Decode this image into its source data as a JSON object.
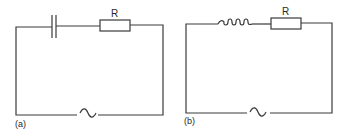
{
  "figure": {
    "circuits": [
      {
        "id": "a",
        "caption": "(a)",
        "components": [
          "capacitor",
          "resistor",
          "ac-source"
        ],
        "resistor_label": "R",
        "source_symbol": "~"
      },
      {
        "id": "b",
        "caption": "(b)",
        "components": [
          "inductor",
          "resistor",
          "ac-source"
        ],
        "resistor_label": "R",
        "source_symbol": "~"
      }
    ],
    "colors": {
      "line": "#3a3a3a",
      "background": "#ffffff"
    }
  }
}
